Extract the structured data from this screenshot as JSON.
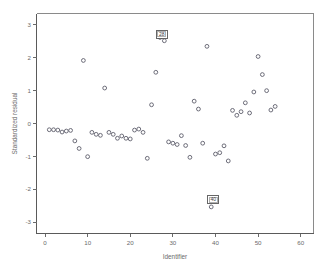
{
  "chart_data": {
    "type": "scatter",
    "title": "",
    "xlabel": "Identifier",
    "ylabel": "Standardized residual",
    "xlim": [
      -2,
      63
    ],
    "ylim": [
      -3.35,
      3.35
    ],
    "xticks": [
      0,
      10,
      20,
      30,
      40,
      50,
      60
    ],
    "xticklabels": [
      "0",
      "10",
      "20",
      "30",
      "40",
      "50",
      "60"
    ],
    "yticks": [
      3,
      2,
      1,
      0,
      -1,
      -2,
      -3
    ],
    "yticklabels": [
      "3",
      "2",
      "1",
      "0",
      "-1",
      "-2",
      "-3"
    ],
    "grid": false,
    "legend": null,
    "marker": "open-circle",
    "marker_color": "#5e5e6b",
    "x": [
      1,
      2,
      3,
      4,
      5,
      6,
      7,
      8,
      9,
      10,
      11,
      12,
      13,
      14,
      15,
      16,
      17,
      18,
      19,
      20,
      21,
      22,
      23,
      24,
      25,
      26,
      27,
      28,
      29,
      30,
      31,
      32,
      33,
      34,
      35,
      36,
      37,
      38,
      39,
      40,
      41,
      42,
      43,
      44,
      45,
      46,
      47,
      48,
      49,
      50,
      51,
      52,
      53,
      54
    ],
    "y": [
      -0.19,
      -0.19,
      -0.2,
      -0.26,
      -0.23,
      -0.21,
      -0.53,
      -0.76,
      1.92,
      -1.01,
      -0.27,
      -0.33,
      -0.36,
      1.08,
      -0.27,
      -0.33,
      -0.45,
      -0.38,
      -0.45,
      -0.47,
      -0.2,
      -0.17,
      -0.27,
      -1.06,
      0.57,
      1.56,
      2.62,
      2.52,
      -0.56,
      -0.6,
      -0.64,
      -0.37,
      -0.67,
      -1.03,
      0.68,
      0.44,
      -0.6,
      2.35,
      -2.54,
      -0.93,
      -0.89,
      -0.68,
      -1.14,
      0.4,
      0.25,
      0.36,
      0.63,
      0.32,
      0.96,
      2.04,
      1.49,
      1.0,
      0.41,
      0.52
    ],
    "annotations": [
      {
        "label": "28",
        "x": 27,
        "y": 2.62,
        "box_x": 27.4,
        "box_y": 2.72
      },
      {
        "label": "40",
        "x": 39,
        "y": -2.54,
        "box_x": 39.5,
        "box_y": -2.32
      }
    ]
  },
  "axes": {
    "x_title": "Identifier",
    "y_title": "Standardized residual"
  }
}
